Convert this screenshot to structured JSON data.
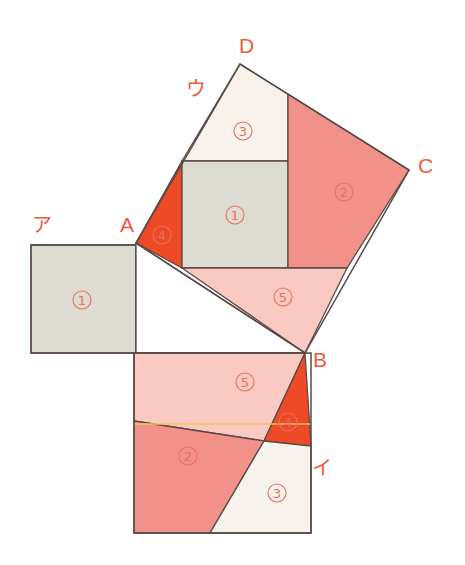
{
  "figure": {
    "canvas": {
      "width": 465,
      "height": 565,
      "background": "#ffffff"
    },
    "colors": {
      "gray_piece": "#dcdcd2",
      "salmon_piece": "#f2918a",
      "light_pink_piece": "#f9c9c2",
      "orange_red_piece": "#ef4a28",
      "cream_piece": "#f7f2ec",
      "white_piece": "#ffffff",
      "outline": "#5a4a46",
      "label_red": "#ef5a3a",
      "accent_yellow": "#f2c45a"
    },
    "vertex_labels": [
      {
        "name": "A",
        "text": "A",
        "x": 120,
        "y": 232
      },
      {
        "name": "B",
        "text": "B",
        "x": 313,
        "y": 367
      },
      {
        "name": "C",
        "text": "C",
        "x": 418,
        "y": 173
      },
      {
        "name": "D",
        "text": "D",
        "x": 239,
        "y": 53
      }
    ],
    "kana_labels": [
      {
        "name": "a-kana",
        "text": "ア",
        "x": 32,
        "y": 232
      },
      {
        "name": "i-kana",
        "text": "イ",
        "x": 312,
        "y": 475
      },
      {
        "name": "u-kana",
        "text": "ウ",
        "x": 186,
        "y": 96
      }
    ],
    "piece_numbers": [
      {
        "name": "piece-1-left-square",
        "text": "1",
        "x": 82,
        "y": 300
      },
      {
        "name": "piece-1-tilted-square",
        "text": "1",
        "x": 235,
        "y": 215
      },
      {
        "name": "piece-2-tilted-square",
        "text": "2",
        "x": 344,
        "y": 192
      },
      {
        "name": "piece-2-bottom-square",
        "text": "2",
        "x": 188,
        "y": 456
      },
      {
        "name": "piece-3-tilted-square",
        "text": "3",
        "x": 243,
        "y": 131
      },
      {
        "name": "piece-3-bottom-square",
        "text": "3",
        "x": 277,
        "y": 493
      },
      {
        "name": "piece-4-tilted-square",
        "text": "4",
        "x": 162,
        "y": 235
      },
      {
        "name": "piece-4-bottom-square",
        "text": "4",
        "x": 288,
        "y": 422
      },
      {
        "name": "piece-5-tilted-square",
        "text": "5",
        "x": 283,
        "y": 297
      },
      {
        "name": "piece-5-bottom-square",
        "text": "5",
        "x": 245,
        "y": 382
      }
    ],
    "shapes": {
      "left_square": {
        "label": "ア",
        "outline": "31,245 136,245 136,353 31,353",
        "pieces": [
          {
            "name": "left-square-piece-1",
            "points": "31,245 136,245 136,353 31,353",
            "fill": "#dcdcd2"
          }
        ]
      },
      "bottom_square": {
        "label": "イ",
        "outline": "134,353 311,353 311,533 134,533",
        "pieces": [
          {
            "name": "bottom-square-piece-5",
            "points": "134,353 305,353 264,441 134,421",
            "fill": "#f9c9c2"
          },
          {
            "name": "bottom-square-piece-2",
            "points": "134,421 264,441 210,533 134,533",
            "fill": "#f2918a"
          },
          {
            "name": "bottom-square-piece-4",
            "points": "305,353 311,446 264,441",
            "fill": "#ef4a28"
          },
          {
            "name": "bottom-square-piece-3",
            "points": "264,441 311,446 311,533 210,533",
            "fill": "#f7f2ec"
          }
        ],
        "accent_line": {
          "name": "bottom-square-yellow-line",
          "x1": 134,
          "y1": 424,
          "x2": 311,
          "y2": 424,
          "stroke": "#f2c45a"
        }
      },
      "tilted_square": {
        "label": "ウ",
        "outline": "136,243 240,64 409,170 305,353",
        "pieces": [
          {
            "name": "tilted-square-piece-4",
            "points": "136,243 182,161 182,268",
            "fill": "#ef4a28"
          },
          {
            "name": "tilted-square-piece-3",
            "points": "182,161 240,64 288,94 288,161",
            "fill": "#f7f2ec"
          },
          {
            "name": "tilted-square-piece-1",
            "points": "182,161 288,161 288,268 182,268",
            "fill": "#dcdcd2"
          },
          {
            "name": "tilted-square-piece-2",
            "points": "288,94 409,170 347,268 288,268",
            "fill": "#f2918a"
          },
          {
            "name": "tilted-square-piece-5",
            "points": "182,268 347,268 305,353",
            "fill": "#f9c9c2"
          }
        ]
      },
      "center_triangle": {
        "name": "center-right-triangle",
        "points": "136,243 305,353 136,353",
        "fill": "#ffffff"
      }
    }
  }
}
